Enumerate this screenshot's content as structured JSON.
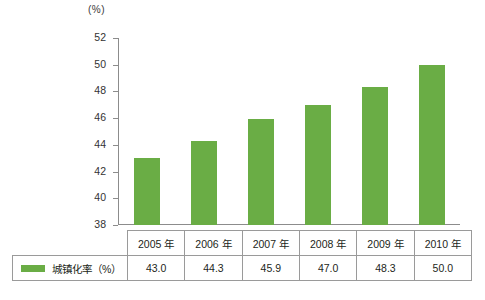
{
  "unit_label": "(%)",
  "axis": {
    "ticks": [
      52,
      50,
      48,
      46,
      44,
      42,
      40,
      38
    ]
  },
  "legend": {
    "series_label": "城镇化率（%）",
    "swatch_color": "#6aad45"
  },
  "chart_data": {
    "type": "bar",
    "title": "",
    "xlabel": "",
    "ylabel": "(%)",
    "ylim": [
      38,
      52
    ],
    "grid": false,
    "legend_position": "table-row",
    "categories": [
      "2005 年",
      "2006 年",
      "2007 年",
      "2008 年",
      "2009 年",
      "2010 年"
    ],
    "series": [
      {
        "name": "城镇化率（%）",
        "color": "#6aad45",
        "values": [
          43.0,
          44.3,
          45.9,
          47.0,
          48.3,
          50.0
        ],
        "value_labels": [
          "43.0",
          "44.3",
          "45.9",
          "47.0",
          "48.3",
          "50.0"
        ]
      }
    ]
  }
}
